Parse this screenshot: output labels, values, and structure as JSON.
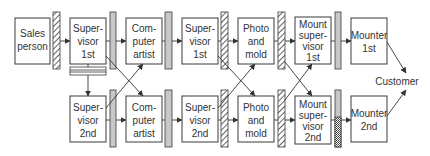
{
  "diagram": {
    "type": "process-flow",
    "nodes": {
      "sales_person": [
        "Sales",
        "person"
      ],
      "supervisor_1st_a": [
        "Super-",
        "visor",
        "1st"
      ],
      "supervisor_2nd_a": [
        "Super-",
        "visor",
        "2nd"
      ],
      "computer_artist_1": [
        "Com-",
        "puter",
        "artist"
      ],
      "computer_artist_2": [
        "Com-",
        "puter",
        "artist"
      ],
      "supervisor_1st_b": [
        "Super-",
        "visor",
        "1st"
      ],
      "supervisor_2nd_b": [
        "Super-",
        "visor",
        "2nd"
      ],
      "photo_mold_1": [
        "Photo",
        "and",
        "mold"
      ],
      "photo_mold_2": [
        "Photo",
        "and",
        "mold"
      ],
      "mount_supervisor_1st": [
        "Mount",
        "super-",
        "visor",
        "1st"
      ],
      "mount_supervisor_2nd": [
        "Mount",
        "super-",
        "visor",
        "2nd"
      ],
      "mounter_1st": [
        "Mounter",
        "1st"
      ],
      "mounter_2nd": [
        "Mounter",
        "2nd"
      ],
      "customer": "Customer"
    },
    "colors": {
      "stroke": "#3a3a3a",
      "gray_bar": "#c8c8c8",
      "text": "#333333",
      "background": "#ffffff"
    }
  }
}
